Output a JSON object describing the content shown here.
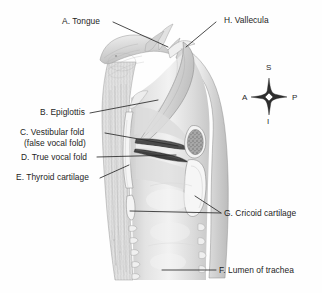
{
  "figure": {
    "background_color": "#fefefe",
    "label_color": "#1d1d1d",
    "leader_line_color": "#2b2b2b",
    "tissue_light": "#ededed",
    "tissue_mid": "#d5d5d5",
    "tissue_dark": "#9a9a9a",
    "cartilage_color": "#f4f4f4",
    "lumen_color": "#e6e6e6"
  },
  "labels": [
    {
      "id": "A",
      "key": "tongue",
      "text": "A. Tongue",
      "letter": "A"
    },
    {
      "id": "B",
      "key": "epiglottis",
      "text": "B. Epiglottis",
      "letter": "B"
    },
    {
      "id": "C",
      "key": "vestibular-fold",
      "text": "C. Vestibular fold",
      "text2": "(false vocal fold)",
      "letter": "C"
    },
    {
      "id": "D",
      "key": "true-vocal-fold",
      "text": "D. True vocal fold",
      "letter": "D"
    },
    {
      "id": "E",
      "key": "thyroid-cartilage",
      "text": "E. Thyroid cartilage",
      "letter": "E"
    },
    {
      "id": "F",
      "key": "lumen-of-trachea",
      "text": "F. Lumen of trachea",
      "letter": "F"
    },
    {
      "id": "G",
      "key": "cricoid-cartilage",
      "text": "G. Cricoid cartilage",
      "letter": "G"
    },
    {
      "id": "H",
      "key": "vallecula",
      "text": "H. Vallecula",
      "letter": "H"
    }
  ],
  "compass": {
    "name": "anatomical-orientation-compass",
    "superior": "S",
    "inferior": "I",
    "anterior": "A",
    "posterior": "P"
  }
}
